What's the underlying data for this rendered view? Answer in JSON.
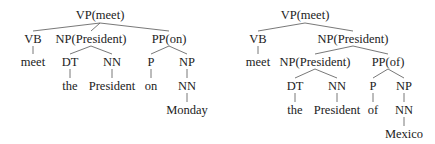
{
  "trees": [
    {
      "name": "left",
      "nodes": [
        {
          "id": "vp",
          "label": "VP(meet)",
          "x": 100,
          "y": 15
        },
        {
          "id": "vb",
          "label": "VB",
          "x": 33,
          "y": 39
        },
        {
          "id": "np",
          "label": "NP(President)",
          "x": 91,
          "y": 39
        },
        {
          "id": "pp",
          "label": "PP(on)",
          "x": 169,
          "y": 39
        },
        {
          "id": "meet",
          "label": "meet",
          "x": 33,
          "y": 62
        },
        {
          "id": "dt",
          "label": "DT",
          "x": 70,
          "y": 62
        },
        {
          "id": "nn",
          "label": "NN",
          "x": 112,
          "y": 62
        },
        {
          "id": "p",
          "label": "P",
          "x": 151,
          "y": 62
        },
        {
          "id": "np2",
          "label": "NP",
          "x": 187,
          "y": 62
        },
        {
          "id": "the",
          "label": "the",
          "x": 70,
          "y": 86
        },
        {
          "id": "president",
          "label": "President",
          "x": 112,
          "y": 86
        },
        {
          "id": "on",
          "label": "on",
          "x": 151,
          "y": 86
        },
        {
          "id": "nn2",
          "label": "NN",
          "x": 187,
          "y": 86
        },
        {
          "id": "monday",
          "label": "Monday",
          "x": 187,
          "y": 110
        }
      ]
    },
    {
      "name": "right",
      "nodes": [
        {
          "id": "vp",
          "label": "VP(meet)",
          "x": 305,
          "y": 15
        },
        {
          "id": "vb",
          "label": "VB",
          "x": 258,
          "y": 39
        },
        {
          "id": "np",
          "label": "NP(President)",
          "x": 353,
          "y": 39
        },
        {
          "id": "meet",
          "label": "meet",
          "x": 258,
          "y": 62
        },
        {
          "id": "np_inner",
          "label": "NP(President)",
          "x": 315,
          "y": 62
        },
        {
          "id": "pp",
          "label": "PP(of)",
          "x": 388,
          "y": 62
        },
        {
          "id": "dt",
          "label": "DT",
          "x": 295,
          "y": 86
        },
        {
          "id": "nn",
          "label": "NN",
          "x": 337,
          "y": 86
        },
        {
          "id": "p",
          "label": "P",
          "x": 373,
          "y": 86
        },
        {
          "id": "np2",
          "label": "NP",
          "x": 404,
          "y": 86
        },
        {
          "id": "the",
          "label": "the",
          "x": 295,
          "y": 110
        },
        {
          "id": "president",
          "label": "President",
          "x": 337,
          "y": 110
        },
        {
          "id": "of",
          "label": "of",
          "x": 373,
          "y": 110
        },
        {
          "id": "nn2",
          "label": "NN",
          "x": 404,
          "y": 110
        },
        {
          "id": "mexico",
          "label": "Mexico",
          "x": 404,
          "y": 134
        }
      ]
    }
  ]
}
